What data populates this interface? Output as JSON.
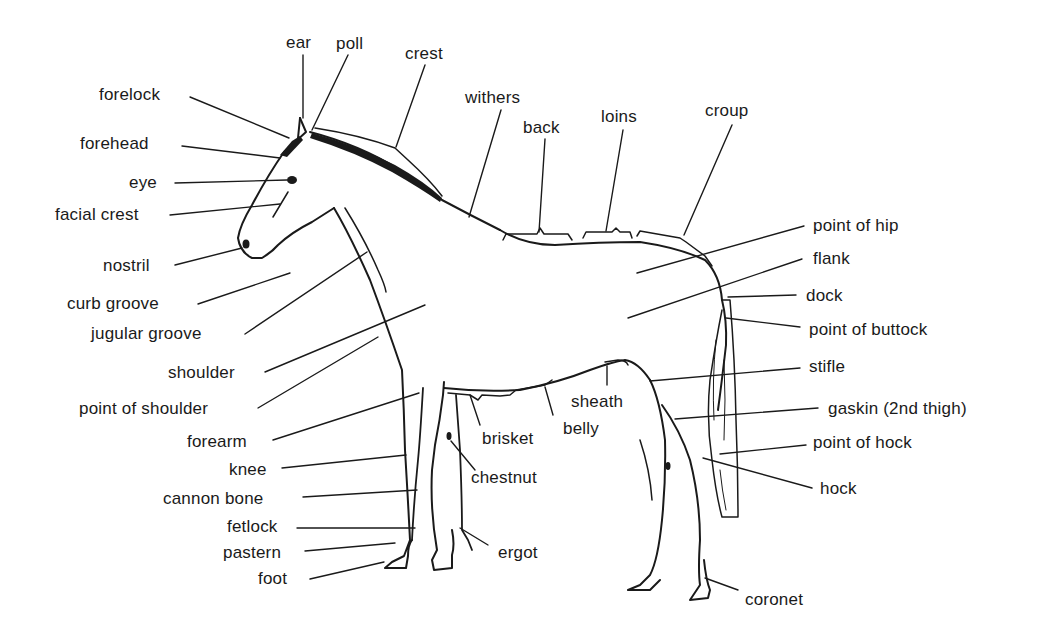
{
  "diagram": {
    "labels": {
      "ear": "ear",
      "poll": "poll",
      "crest": "crest",
      "forelock": "forelock",
      "withers": "withers",
      "back": "back",
      "loins": "loins",
      "croup": "croup",
      "forehead": "forehead",
      "eye": "eye",
      "facial_crest": "facial crest",
      "nostril": "nostril",
      "curb_groove": "curb groove",
      "jugular_groove": "jugular groove",
      "shoulder": "shoulder",
      "point_of_shoulder": "point of shoulder",
      "forearm": "forearm",
      "knee": "knee",
      "cannon_bone": "cannon bone",
      "fetlock": "fetlock",
      "pastern": "pastern",
      "foot": "foot",
      "brisket": "brisket",
      "chestnut": "chestnut",
      "ergot": "ergot",
      "sheath": "sheath",
      "belly": "belly",
      "point_of_hip": "point of hip",
      "flank": "flank",
      "dock": "dock",
      "point_of_buttock": "point of buttock",
      "stifle": "stifle",
      "gaskin": "gaskin (2nd thigh)",
      "point_of_hock": "point of hock",
      "hock": "hock",
      "coronet": "coronet"
    },
    "colors": {
      "ink": "#1a1a1a",
      "background": "#ffffff"
    }
  }
}
